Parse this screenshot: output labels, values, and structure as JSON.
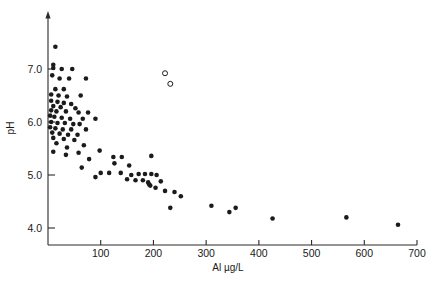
{
  "figure": {
    "background_color": "#ffffff",
    "marker_color": "#1b1b1b",
    "axis_color": "#2b2b2b"
  },
  "chart_data": {
    "type": "scatter",
    "title": "",
    "xlabel": "Al µg/L",
    "ylabel": "pH",
    "xlim": [
      0,
      700
    ],
    "ylim": [
      3.75,
      7.7
    ],
    "grid": false,
    "legend": "none",
    "xticks": [
      100,
      200,
      300,
      400,
      500,
      600,
      700
    ],
    "xtick_labels": [
      "100",
      "200",
      "300",
      "400",
      "500",
      "600",
      "700"
    ],
    "yticks": [
      4.0,
      5.0,
      6.0,
      7.0
    ],
    "ytick_labels": [
      "4.0",
      "5.0",
      "6.0",
      "7.0"
    ],
    "series": [
      {
        "name": "samples",
        "marker": "filled-circle",
        "points": [
          [
            14,
            7.42
          ],
          [
            10,
            7.08
          ],
          [
            10,
            7.02
          ],
          [
            26,
            7.0
          ],
          [
            46,
            7.0
          ],
          [
            8,
            6.88
          ],
          [
            22,
            6.82
          ],
          [
            40,
            6.82
          ],
          [
            72,
            6.82
          ],
          [
            14,
            6.62
          ],
          [
            30,
            6.62
          ],
          [
            6,
            6.52
          ],
          [
            20,
            6.5
          ],
          [
            36,
            6.48
          ],
          [
            62,
            6.5
          ],
          [
            6,
            6.4
          ],
          [
            18,
            6.38
          ],
          [
            30,
            6.36
          ],
          [
            44,
            6.34
          ],
          [
            10,
            6.3
          ],
          [
            24,
            6.28
          ],
          [
            52,
            6.26
          ],
          [
            6,
            6.22
          ],
          [
            16,
            6.2
          ],
          [
            34,
            6.2
          ],
          [
            58,
            6.18
          ],
          [
            76,
            6.18
          ],
          [
            4,
            6.12
          ],
          [
            12,
            6.1
          ],
          [
            26,
            6.08
          ],
          [
            42,
            6.06
          ],
          [
            66,
            6.06
          ],
          [
            90,
            6.06
          ],
          [
            6,
            6.0
          ],
          [
            18,
            5.98
          ],
          [
            32,
            5.98
          ],
          [
            48,
            5.96
          ],
          [
            60,
            5.96
          ],
          [
            4,
            5.9
          ],
          [
            14,
            5.88
          ],
          [
            28,
            5.86
          ],
          [
            44,
            5.86
          ],
          [
            72,
            5.86
          ],
          [
            8,
            5.8
          ],
          [
            22,
            5.78
          ],
          [
            38,
            5.76
          ],
          [
            56,
            5.76
          ],
          [
            10,
            5.7
          ],
          [
            30,
            5.68
          ],
          [
            50,
            5.66
          ],
          [
            16,
            5.6
          ],
          [
            68,
            5.56
          ],
          [
            36,
            5.52
          ],
          [
            10,
            5.44
          ],
          [
            58,
            5.42
          ],
          [
            98,
            5.46
          ],
          [
            34,
            5.38
          ],
          [
            78,
            5.3
          ],
          [
            124,
            5.34
          ],
          [
            140,
            5.34
          ],
          [
            196,
            5.36
          ],
          [
            126,
            5.22
          ],
          [
            154,
            5.18
          ],
          [
            64,
            5.14
          ],
          [
            100,
            5.04
          ],
          [
            116,
            5.04
          ],
          [
            138,
            5.04
          ],
          [
            90,
            4.96
          ],
          [
            158,
            5.0
          ],
          [
            172,
            5.02
          ],
          [
            184,
            5.02
          ],
          [
            196,
            5.02
          ],
          [
            206,
            5.0
          ],
          [
            150,
            4.92
          ],
          [
            166,
            4.9
          ],
          [
            180,
            4.9
          ],
          [
            190,
            4.86
          ],
          [
            192,
            4.82
          ],
          [
            194,
            4.8
          ],
          [
            214,
            4.88
          ],
          [
            204,
            4.76
          ],
          [
            222,
            4.7
          ],
          [
            240,
            4.68
          ],
          [
            252,
            4.6
          ],
          [
            232,
            4.38
          ],
          [
            310,
            4.42
          ],
          [
            344,
            4.3
          ],
          [
            356,
            4.38
          ],
          [
            426,
            4.18
          ],
          [
            566,
            4.2
          ],
          [
            664,
            4.06
          ]
        ]
      },
      {
        "name": "outliers",
        "marker": "open-circle",
        "points": [
          [
            222,
            6.92
          ],
          [
            232,
            6.72
          ]
        ]
      }
    ]
  }
}
